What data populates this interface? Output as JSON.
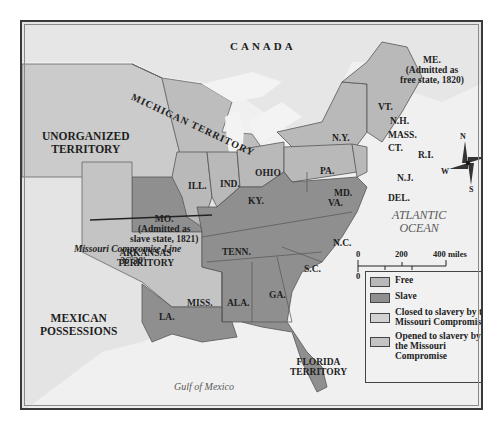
{
  "map": {
    "colors": {
      "free": "#b9b9b9",
      "slave": "#8f8f8f",
      "closed": "#cbcbcb",
      "opened": "#aaaaaa",
      "foreign": "#e8e8e8",
      "water": "#f2f2f2",
      "border": "#555555"
    },
    "labels": {
      "canada": "CANADA",
      "unorganized": [
        "UNORGANIZED",
        "TERRITORY"
      ],
      "michigan": "MICHIGAN TERRITORY",
      "maine": [
        "ME.",
        "(Admitted as",
        "free state, 1820)"
      ],
      "vt": "VT.",
      "nh": "N.H.",
      "mass": "MASS.",
      "ct": "CT.",
      "ri": "R.I.",
      "ny": "N.Y.",
      "pa": "PA.",
      "nj": "N.J.",
      "md": "MD.",
      "del": "DEL.",
      "ohio": "OHIO",
      "ind": "IND.",
      "ill": "ILL.",
      "mo": [
        "MO.",
        "(Admitted as",
        "slave state, 1821)"
      ],
      "ky": "KY.",
      "va": "VA.",
      "nc": "N.C.",
      "tenn": "TENN.",
      "sc": "S.C.",
      "ga": "GA.",
      "ala": "ALA.",
      "miss": "MISS.",
      "la": "LA.",
      "arkansas": [
        "ARKANSAS",
        "TERRITORY"
      ],
      "florida": [
        "FLORIDA",
        "TERRITORY"
      ],
      "mexican": [
        "MEXICAN",
        "POSSESSIONS"
      ],
      "atlantic": [
        "ATLANTIC",
        "OCEAN"
      ],
      "gulf": "Gulf of Mexico",
      "compromise_line": "Missouri Compromise Line",
      "latitude": "36°30′"
    },
    "compass": {
      "n": "N",
      "s": "S",
      "e": "E",
      "w": "W"
    },
    "scale": {
      "miles": [
        "0",
        "200",
        "400 miles"
      ],
      "km": [
        "0",
        "200",
        "400 kilometers"
      ]
    },
    "legend": [
      {
        "label": "Free",
        "color": "#b9b9b9"
      },
      {
        "label": "Slave",
        "color": "#8f8f8f"
      },
      {
        "label": "Closed to slavery by the Missouri Compromise",
        "color": "#d2d2d2"
      },
      {
        "label": "Opened to slavery by the Missouri Compromise",
        "color": "#c4c4c4"
      }
    ]
  }
}
